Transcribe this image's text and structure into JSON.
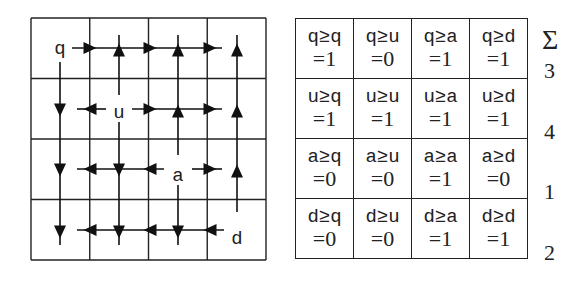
{
  "diagram": {
    "grid": {
      "rows": 4,
      "cols": 4,
      "x0": 31,
      "y0": 18,
      "cell_w": 58.75,
      "cell_h": 60.5
    },
    "nodes": [
      {
        "label": "q",
        "x": 60,
        "y": 48
      },
      {
        "label": "u",
        "x": 119,
        "y": 112
      },
      {
        "label": "a",
        "x": 178,
        "y": 175
      },
      {
        "label": "d",
        "x": 237,
        "y": 238
      }
    ],
    "lines": [
      [
        72,
        48,
        222,
        48
      ],
      [
        60,
        62,
        60,
        245
      ],
      [
        119,
        35,
        119,
        95
      ],
      [
        178,
        35,
        178,
        155
      ],
      [
        237,
        35,
        237,
        212
      ],
      [
        77,
        109,
        106,
        109
      ],
      [
        132,
        109,
        222,
        109
      ],
      [
        119,
        122,
        119,
        245
      ],
      [
        77,
        169,
        164,
        169
      ],
      [
        192,
        169,
        222,
        169
      ],
      [
        178,
        185,
        178,
        245
      ],
      [
        77,
        230,
        224,
        230
      ]
    ],
    "arrowheads": [
      {
        "x": 90,
        "y": 48,
        "dir": "right"
      },
      {
        "x": 150,
        "y": 48,
        "dir": "right"
      },
      {
        "x": 210,
        "y": 48,
        "dir": "right"
      },
      {
        "x": 119,
        "y": 50,
        "dir": "up"
      },
      {
        "x": 178,
        "y": 50,
        "dir": "up"
      },
      {
        "x": 237,
        "y": 50,
        "dir": "up"
      },
      {
        "x": 60,
        "y": 110,
        "dir": "down"
      },
      {
        "x": 60,
        "y": 170,
        "dir": "down"
      },
      {
        "x": 60,
        "y": 232,
        "dir": "down"
      },
      {
        "x": 90,
        "y": 109,
        "dir": "left"
      },
      {
        "x": 150,
        "y": 109,
        "dir": "right"
      },
      {
        "x": 210,
        "y": 109,
        "dir": "right"
      },
      {
        "x": 178,
        "y": 111,
        "dir": "up"
      },
      {
        "x": 237,
        "y": 111,
        "dir": "up"
      },
      {
        "x": 237,
        "y": 171,
        "dir": "up"
      },
      {
        "x": 119,
        "y": 170,
        "dir": "down"
      },
      {
        "x": 119,
        "y": 232,
        "dir": "down"
      },
      {
        "x": 90,
        "y": 169,
        "dir": "left"
      },
      {
        "x": 150,
        "y": 169,
        "dir": "left"
      },
      {
        "x": 210,
        "y": 169,
        "dir": "right"
      },
      {
        "x": 178,
        "y": 232,
        "dir": "down"
      },
      {
        "x": 90,
        "y": 230,
        "dir": "left"
      },
      {
        "x": 150,
        "y": 230,
        "dir": "left"
      },
      {
        "x": 210,
        "y": 230,
        "dir": "left"
      }
    ]
  },
  "table": {
    "rows": [
      [
        {
          "expr": "q≥q",
          "val": "=1"
        },
        {
          "expr": "q≥u",
          "val": "=0"
        },
        {
          "expr": "q≥a",
          "val": "=1"
        },
        {
          "expr": "q≥d",
          "val": "=1"
        }
      ],
      [
        {
          "expr": "u≥q",
          "val": "=1"
        },
        {
          "expr": "u≥u",
          "val": "=1"
        },
        {
          "expr": "u≥a",
          "val": "=1"
        },
        {
          "expr": "u≥d",
          "val": "=1"
        }
      ],
      [
        {
          "expr": "a≥q",
          "val": "=0"
        },
        {
          "expr": "a≥u",
          "val": "=0"
        },
        {
          "expr": "a≥a",
          "val": "=1"
        },
        {
          "expr": "a≥d",
          "val": "=0"
        }
      ],
      [
        {
          "expr": "d≥q",
          "val": "=0"
        },
        {
          "expr": "d≥u",
          "val": "=0"
        },
        {
          "expr": "d≥a",
          "val": "=1"
        },
        {
          "expr": "d≥d",
          "val": "=1"
        }
      ]
    ]
  },
  "sums": {
    "header": "Σ",
    "values": [
      "3",
      "4",
      "1",
      "2"
    ]
  }
}
